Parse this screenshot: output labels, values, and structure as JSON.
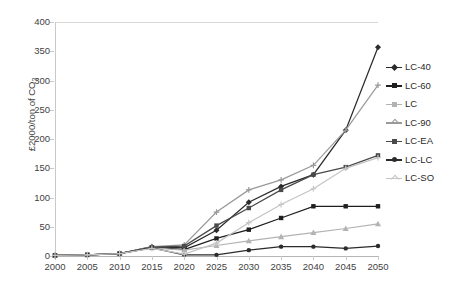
{
  "chart_data": {
    "type": "line",
    "title": "",
    "xlabel": "",
    "ylabel": "£2000/ton of CO",
    "ylabel_sub": "2",
    "x": [
      2000,
      2005,
      2010,
      2015,
      2020,
      2025,
      2030,
      2035,
      2040,
      2045,
      2050
    ],
    "xlim": [
      2000,
      2050
    ],
    "ylim": [
      0,
      400
    ],
    "yticks": [
      0,
      50,
      100,
      150,
      200,
      250,
      300,
      350,
      400
    ],
    "xticks": [
      2000,
      2005,
      2010,
      2015,
      2020,
      2025,
      2030,
      2035,
      2040,
      2045,
      2050
    ],
    "grid": false,
    "legend_position": "right",
    "series": [
      {
        "name": "LC-40",
        "color": "#2b2b2b",
        "marker": "diamond",
        "values": [
          1,
          2,
          4,
          16,
          14,
          44,
          92,
          119,
          139,
          215,
          357
        ]
      },
      {
        "name": "LC-60",
        "color": "#1f1f1f",
        "marker": "square",
        "values": [
          1,
          2,
          4,
          15,
          11,
          30,
          45,
          65,
          85,
          85,
          85
        ]
      },
      {
        "name": "LC",
        "color": "#b3b3b3",
        "marker": "triangle",
        "values": [
          1,
          2,
          4,
          14,
          10,
          18,
          26,
          33,
          40,
          47,
          55
        ]
      },
      {
        "name": "LC-90",
        "color": "#9a9a9a",
        "marker": "cross",
        "values": [
          1,
          2,
          4,
          16,
          19,
          75,
          113,
          130,
          155,
          215,
          292
        ]
      },
      {
        "name": "LC-EA",
        "color": "#4a4a4a",
        "marker": "square",
        "values": [
          1,
          2,
          4,
          15,
          17,
          52,
          82,
          113,
          139,
          152,
          172
        ]
      },
      {
        "name": "LC-LC",
        "color": "#2b2b2b",
        "marker": "circle",
        "values": [
          1,
          2,
          4,
          14,
          2,
          2,
          10,
          16,
          16,
          13,
          17
        ]
      },
      {
        "name": "LC-SO",
        "color": "#c4c4c4",
        "marker": "plus",
        "values": [
          1,
          2,
          4,
          13,
          3,
          22,
          57,
          88,
          115,
          150,
          168
        ]
      }
    ]
  }
}
